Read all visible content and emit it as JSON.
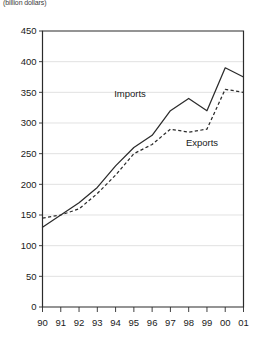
{
  "units_note": "(billion dollars)",
  "chart_data": {
    "type": "line",
    "title": "",
    "subtitle": "",
    "xlabel": "",
    "ylabel": "(billion dollars)",
    "grid": true,
    "legend_position": "inline-annotation",
    "categories": [
      "90",
      "91",
      "92",
      "93",
      "94",
      "95",
      "96",
      "97",
      "98",
      "99",
      "00",
      "01"
    ],
    "x_tick_labels": [
      "90",
      "91",
      "92",
      "93",
      "94",
      "95",
      "96",
      "97",
      "98",
      "99",
      "00",
      "01"
    ],
    "y_tick_labels": [
      "0",
      "50",
      "100",
      "150",
      "200",
      "250",
      "300",
      "350",
      "400",
      "450"
    ],
    "y_ticks": [
      0,
      50,
      100,
      150,
      200,
      250,
      300,
      350,
      400,
      450
    ],
    "ylim": [
      0,
      450
    ],
    "series": [
      {
        "name": "Imports",
        "style": "solid",
        "color": "#2b2b2b",
        "label_x_category": "95",
        "values": [
          130,
          150,
          170,
          195,
          230,
          260,
          280,
          320,
          340,
          320,
          390,
          375
        ]
      },
      {
        "name": "Exports",
        "style": "dashed",
        "color": "#2b2b2b",
        "label_x_category": "97",
        "values": [
          145,
          150,
          160,
          185,
          215,
          250,
          265,
          290,
          285,
          290,
          355,
          350
        ]
      }
    ],
    "annotations": [
      {
        "text": "Imports",
        "x": 130,
        "y": 97
      },
      {
        "text": "Exports",
        "x": 202,
        "y": 146
      }
    ]
  }
}
